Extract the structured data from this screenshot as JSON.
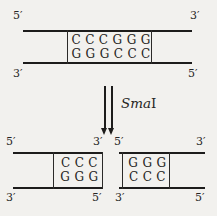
{
  "colors": {
    "background": "#f2f1ee",
    "ink": "#1d1c1b",
    "text": "#262523"
  },
  "enzyme_label": {
    "italic_part": "Sma",
    "roman_part": "I"
  },
  "top_duplex": {
    "top_left_end": "5′",
    "top_right_end": "3′",
    "bottom_left_end": "3′",
    "bottom_right_end": "5′",
    "top_sequence": "CCCGGG",
    "bottom_sequence": "GGGCCC"
  },
  "left_fragment": {
    "top_left_end": "5′",
    "top_right_end": "3′",
    "bottom_left_end": "3′",
    "bottom_right_end": "5′",
    "top_sequence": "CCC",
    "bottom_sequence": "GGG"
  },
  "right_fragment": {
    "top_left_end": "5′",
    "top_right_end": "3′",
    "bottom_left_end": "3′",
    "bottom_right_end": "5′",
    "top_sequence": "GGG",
    "bottom_sequence": "CCC"
  }
}
